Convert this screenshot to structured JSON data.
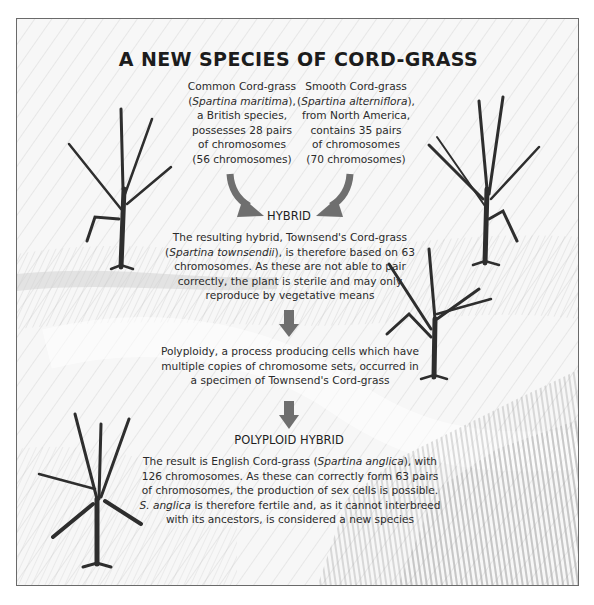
{
  "title": "A NEW SPECIES OF CORD-GRASS",
  "parents": {
    "left": {
      "line1": "Common Cord-grass",
      "open": "(",
      "latin": "Spartina maritima",
      "close": "),",
      "line3": "a British species,",
      "line4": "possesses 28 pairs",
      "line5": "of chromosomes",
      "line6": "(56 chromosomes)"
    },
    "right": {
      "line1": "Smooth Cord-grass",
      "open": "(",
      "latin": "Spartina alterniflora",
      "close": "),",
      "line3": "from North America,",
      "line4": "contains 35 pairs",
      "line5": "of chromosomes",
      "line6": "(70 chromosomes)"
    }
  },
  "hybrid": {
    "label": "HYBRID",
    "line1": "The resulting hybrid, Townsend's Cord-grass",
    "line2_open": "(",
    "line2_latin": "Spartina townsendii",
    "line2_rest": "), is therefore based on 63",
    "line3": "chromosomes. As these are not able to pair",
    "line4": "correctly, the plant is sterile and may only",
    "line5": "reproduce by vegetative means"
  },
  "polyploidy": {
    "line1": "Polyploidy, a process producing cells which have",
    "line2": "multiple copies of chromosome sets, occurred in",
    "line3": "a specimen of Townsend's Cord-grass"
  },
  "polyploid_hybrid": {
    "label": "POLYPLOID HYBRID",
    "line1_pre": "The result is English Cord-grass (",
    "line1_latin": "Spartina anglica",
    "line1_post": "), with",
    "line2": "126 chromosomes. As these can correctly form 63 pairs",
    "line3": "of chromosomes, the production of sex cells is possible.",
    "line4_latin": "S. anglica",
    "line4_rest": " is therefore fertile and, as it cannot interbreed",
    "line5": "with its ancestors, is considered a new species"
  },
  "icons": {
    "plants": [
      "grass-plant-icon",
      "grass-plant-icon",
      "grass-plant-icon",
      "grass-plant-icon"
    ],
    "arrows": [
      "curved-arrow-icon",
      "curved-arrow-icon",
      "down-arrow-icon",
      "down-arrow-icon"
    ]
  },
  "colors": {
    "arrow": "#6f6f6f",
    "text": "#2a2a2a",
    "plant": "#3a3a3a",
    "frame": "#6a6a6a"
  }
}
